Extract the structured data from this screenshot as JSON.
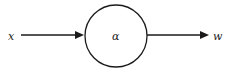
{
  "diagram": {
    "input_label": "x",
    "node_label": "α",
    "output_label": "w",
    "stroke_color": "#1a1a1a",
    "background": "#ffffff"
  }
}
